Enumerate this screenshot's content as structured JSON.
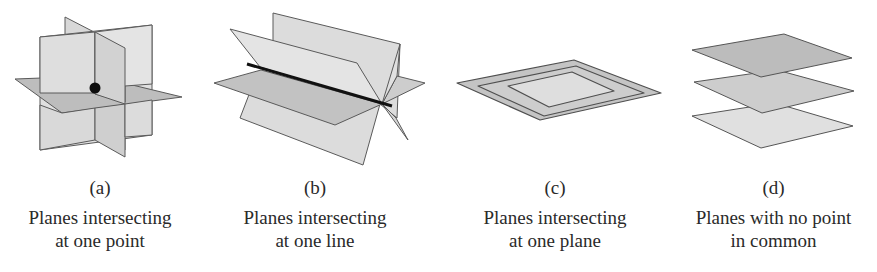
{
  "figure": {
    "panels": [
      {
        "id": "a",
        "letter": "(a)",
        "caption_line1": "Planes intersecting",
        "caption_line2": "at one point",
        "illustration": "three-planes-meeting-at-point"
      },
      {
        "id": "b",
        "letter": "(b)",
        "caption_line1": "Planes intersecting",
        "caption_line2": "at one line",
        "illustration": "three-planes-sharing-line"
      },
      {
        "id": "c",
        "letter": "(c)",
        "caption_line1": "Planes intersecting",
        "caption_line2": "at one plane",
        "illustration": "coincident-planes"
      },
      {
        "id": "d",
        "letter": "(d)",
        "caption_line1": "Planes with no point",
        "caption_line2": "in common",
        "illustration": "parallel-stacked-planes"
      }
    ],
    "colors": {
      "plane_light": "#e2e2e2",
      "plane_mid": "#cfcfcf",
      "plane_dark": "#b9b9b9",
      "edge": "#555555",
      "intersection": "#111111"
    }
  }
}
